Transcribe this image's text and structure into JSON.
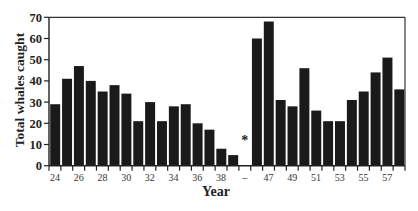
{
  "chart_data": {
    "type": "bar",
    "title": "",
    "xlabel": "Year",
    "ylabel": "Total whales caught",
    "ylim": [
      0,
      70
    ],
    "yticks": [
      0,
      10,
      20,
      30,
      40,
      50,
      60,
      70
    ],
    "grid": false,
    "legend": null,
    "categories": [
      "24",
      "25",
      "26",
      "27",
      "28",
      "29",
      "30",
      "31",
      "32",
      "33",
      "34",
      "35",
      "36",
      "37",
      "38",
      "39",
      "–",
      "46",
      "47",
      "48",
      "49",
      "50",
      "51",
      "52",
      "53",
      "54",
      "55",
      "56",
      "57",
      "58"
    ],
    "values": [
      29,
      41,
      47,
      40,
      35,
      38,
      34,
      21,
      30,
      21,
      28,
      29,
      20,
      17,
      8,
      5,
      null,
      60,
      68,
      31,
      28,
      46,
      26,
      21,
      21,
      31,
      35,
      44,
      51,
      36
    ],
    "xtick_labels": [
      "24",
      "26",
      "28",
      "30",
      "32",
      "34",
      "36",
      "38",
      "–",
      "47",
      "49",
      "51",
      "53",
      "55",
      "57"
    ],
    "annotations": [
      {
        "text": "*",
        "position": "gap between 39 and 46"
      }
    ],
    "bar_color": "#1a1a1a"
  }
}
